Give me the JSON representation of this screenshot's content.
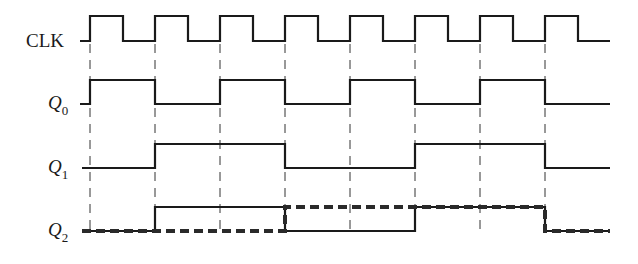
{
  "diagram": {
    "type": "timing-diagram",
    "signals": [
      {
        "name": "CLK",
        "label": "CLK",
        "italic": false,
        "subscript": ""
      },
      {
        "name": "Q0",
        "label": "Q",
        "italic": true,
        "subscript": "0"
      },
      {
        "name": "Q1",
        "label": "Q",
        "italic": true,
        "subscript": "1"
      },
      {
        "name": "Q2",
        "label": "Q",
        "italic": true,
        "subscript": "2"
      }
    ],
    "clock_edges_count": 8,
    "waveforms": {
      "CLK": "0 1 0 1 0 1 0 1 0 1 0 1 0 1 0 1 0",
      "Q0": "0 1 0 1 0 1 0 1 0",
      "Q1": "0 0 1 1 0 0 1 1 0",
      "Q2_solid": "0 0 1 1 0 0 1 1 0",
      "Q2_dashed": "0 0 0 0 1 1 1 1 0"
    },
    "legend_note": "Q2 shown as solid trace and thick dashed trace"
  }
}
